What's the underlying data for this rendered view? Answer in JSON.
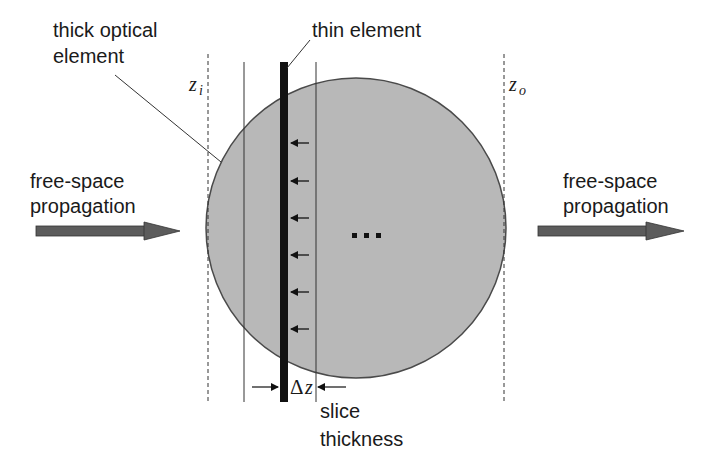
{
  "labels": {
    "thick_element_line1": "thick optical",
    "thick_element_line2": "element",
    "thin_element": "thin element",
    "left_prop_line1": "free-space",
    "left_prop_line2": "propagation",
    "right_prop_line1": "free-space",
    "right_prop_line2": "propagation",
    "z_in": "z",
    "z_in_sub": "i",
    "z_out": "z",
    "z_out_sub": "o",
    "delta": "Δ",
    "delta_z": "z",
    "slice_line1": "slice",
    "slice_line2": "thickness",
    "ellipsis": "…"
  },
  "colors": {
    "circle_fill": "#b8b8b8",
    "circle_stroke": "#4a4a4a",
    "thin_element": "#111111",
    "flow_arrow": "#5c5c5c",
    "lines": "#333333"
  },
  "geometry": {
    "circle": {
      "cx": 356,
      "cy": 228,
      "r": 150
    },
    "z_in_x": 208,
    "z_out_x": 504,
    "slice_left_x": 244,
    "slice_right_x": 316,
    "thin_element_x": 284,
    "small_arrows_y": [
      143,
      181,
      218,
      255,
      292,
      329
    ]
  }
}
